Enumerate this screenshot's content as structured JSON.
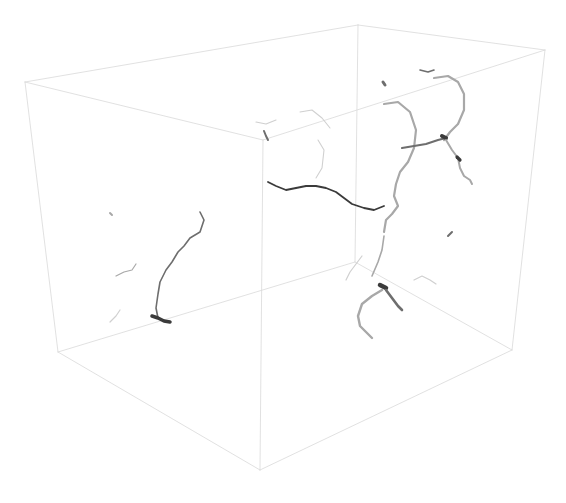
{
  "viewport": {
    "width": 566,
    "height": 503,
    "background": "#ffffff"
  },
  "colors": {
    "box_edge": "#d9d9d9",
    "filament_dark": "#3a3a3a",
    "filament_mid": "#6e6e6e",
    "filament_light": "#a8a8a8",
    "filament_faint": "#d0d0d0"
  },
  "bounding_box": {
    "vertices": {
      "back_top_left": [
        25,
        82
      ],
      "back_top_right": [
        358,
        25
      ],
      "right_top": [
        545,
        50
      ],
      "front_top": [
        263,
        140
      ],
      "bottom_left": [
        58,
        352
      ],
      "front_bottom": [
        260,
        470
      ],
      "right_bottom": [
        512,
        350
      ],
      "back_mid": [
        355,
        262
      ]
    },
    "edges": [
      {
        "name": "top-back-edge",
        "points": "25,82 358,25"
      },
      {
        "name": "top-right-edge",
        "points": "358,25 545,50"
      },
      {
        "name": "top-front-left-edge",
        "points": "25,82 263,140"
      },
      {
        "name": "top-front-right-edge",
        "points": "263,140 545,50"
      },
      {
        "name": "left-vertical-edge",
        "points": "25,82 58,352"
      },
      {
        "name": "front-vertical-edge",
        "points": "263,140 260,470"
      },
      {
        "name": "right-vertical-edge",
        "points": "545,50 512,350"
      },
      {
        "name": "bottom-left-edge",
        "points": "58,352 260,470"
      },
      {
        "name": "bottom-right-edge",
        "points": "260,470 512,350"
      },
      {
        "name": "hidden-back-vertical-edge",
        "points": "358,25 355,262"
      },
      {
        "name": "hidden-back-bottom-left-edge",
        "points": "58,352 355,262"
      },
      {
        "name": "hidden-back-bottom-right-edge",
        "points": "355,262 512,350"
      }
    ]
  },
  "filaments": [
    {
      "name": "left-branch-main",
      "tone": "filament_mid",
      "width": 1.6,
      "points": "200,212 204,220 200,232 190,238 184,246 178,252 172,262 166,270 160,282 158,294 156,308 158,318"
    },
    {
      "name": "left-branch-knot",
      "tone": "filament_dark",
      "width": 3.5,
      "points": "152,316 158,318 164,321 170,322"
    },
    {
      "name": "left-branch-side",
      "tone": "filament_light",
      "width": 1.2,
      "points": "116,276 124,272 132,270 136,264"
    },
    {
      "name": "left-branch-lower",
      "tone": "filament_faint",
      "width": 1.2,
      "points": "110,322 116,316 120,310"
    },
    {
      "name": "left-dot",
      "tone": "filament_light",
      "width": 2,
      "points": "110,213 112,215"
    },
    {
      "name": "front-top-stub",
      "tone": "filament_mid",
      "width": 2,
      "points": "264,131 266,136 268,140"
    },
    {
      "name": "front-top-stub-cap",
      "tone": "filament_faint",
      "width": 1.2,
      "points": "256,122 266,124 276,120"
    },
    {
      "name": "center-horizontal",
      "tone": "filament_dark",
      "width": 1.8,
      "points": "268,182 276,186 286,190 296,188 306,186 316,186 326,188 336,192 344,198 352,204 364,208 374,210 384,206"
    },
    {
      "name": "center-upper-twig",
      "tone": "filament_faint",
      "width": 1.1,
      "points": "300,112 312,110 322,118 330,128"
    },
    {
      "name": "center-mid-twig",
      "tone": "filament_faint",
      "width": 1.1,
      "points": "318,140 324,150 322,168 316,178"
    },
    {
      "name": "right-loop-left-arm",
      "tone": "filament_light",
      "width": 2.2,
      "points": "384,104 398,102 410,112 416,130 414,148 408,162 400,172 396,184 394,196 398,206 392,214 386,220 384,232"
    },
    {
      "name": "right-loop-right-arm",
      "tone": "filament_light",
      "width": 2.2,
      "points": "434,78 448,76 458,82 464,94 464,110 458,124 450,132 444,140"
    },
    {
      "name": "right-loop-bridge",
      "tone": "filament_mid",
      "width": 2,
      "points": "402,148 414,146 426,144 438,140 446,138"
    },
    {
      "name": "right-node",
      "tone": "filament_dark",
      "width": 4,
      "points": "442,136 446,138"
    },
    {
      "name": "right-descender",
      "tone": "filament_light",
      "width": 2,
      "points": "446,140 452,150 458,158 460,168 464,176 470,180 472,184"
    },
    {
      "name": "right-node-2",
      "tone": "filament_dark",
      "width": 3.2,
      "points": "457,157 460,160"
    },
    {
      "name": "right-top-cap",
      "tone": "filament_mid",
      "width": 1.6,
      "points": "420,70 428,72 434,70"
    },
    {
      "name": "right-top-dot",
      "tone": "filament_mid",
      "width": 3,
      "points": "383,82 385,85"
    },
    {
      "name": "right-mid-stub",
      "tone": "filament_mid",
      "width": 2,
      "points": "448,236 452,232"
    },
    {
      "name": "lower-cluster-stem",
      "tone": "filament_light",
      "width": 1.6,
      "points": "384,236 382,250 378,262 372,276"
    },
    {
      "name": "lower-cluster-knot",
      "tone": "filament_dark",
      "width": 4.5,
      "points": "380,285 386,288"
    },
    {
      "name": "lower-cluster-hook",
      "tone": "filament_light",
      "width": 2.4,
      "points": "382,290 372,296 362,304 358,316 360,326 366,332 372,338"
    },
    {
      "name": "lower-cluster-tail",
      "tone": "filament_mid",
      "width": 2.6,
      "points": "386,290 392,298 398,306 402,310"
    },
    {
      "name": "lower-cluster-twig",
      "tone": "filament_faint",
      "width": 1.2,
      "points": "414,280 422,276 430,280 436,284"
    },
    {
      "name": "lower-cluster-left",
      "tone": "filament_faint",
      "width": 1.2,
      "points": "346,280 350,272 356,264 362,256"
    }
  ]
}
